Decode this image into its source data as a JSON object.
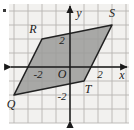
{
  "figure": {
    "type": "coordinate-grid-diagram",
    "background_color": "#f2f1ef",
    "grid_color": "#b8b6b2",
    "axis_color": "#1a1a1a",
    "shape_fill": "#9b9b99",
    "shape_stroke": "#222222",
    "axes": {
      "x_label": "x",
      "y_label": "y",
      "origin_label": "O"
    },
    "tick_labels": {
      "x_positive": "2",
      "x_negative": "-2",
      "y_positive": "2",
      "y_negative": "-2"
    },
    "polygon": {
      "name": "QRST",
      "vertices": [
        {
          "label": "Q",
          "x": -4,
          "y": -2
        },
        {
          "label": "R",
          "x": -2,
          "y": 2
        },
        {
          "label": "S",
          "x": 3,
          "y": 3
        },
        {
          "label": "T",
          "x": 1,
          "y": -1
        }
      ]
    },
    "grid": {
      "x_min": -4.3,
      "x_max": 4.2,
      "y_min": -3.9,
      "y_max": 4.4,
      "cell_size": 14
    }
  }
}
